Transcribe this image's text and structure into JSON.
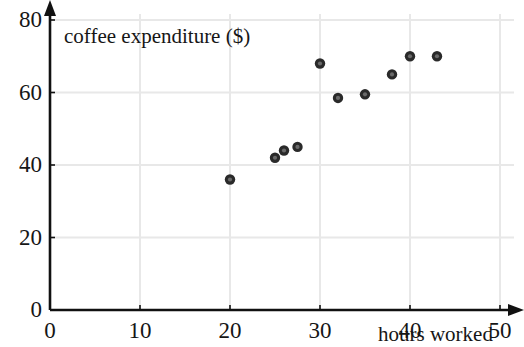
{
  "chart_data": {
    "type": "scatter",
    "title": "",
    "xlabel": "hours worked",
    "ylabel": "coffee expenditure ($)",
    "xlim": [
      0,
      50
    ],
    "ylim": [
      0,
      80
    ],
    "xticks": [
      0,
      10,
      20,
      30,
      40,
      50
    ],
    "yticks": [
      0,
      20,
      40,
      60,
      80
    ],
    "xtick_labels": [
      "0",
      "10",
      "20",
      "30",
      "40",
      "50"
    ],
    "ytick_labels": [
      "0",
      "20",
      "40",
      "60",
      "80"
    ],
    "grid": true,
    "grid_color": "#e8e8e8",
    "legend": null,
    "marker_color": "#3b3b3b",
    "axis_color": "#111111",
    "points": [
      {
        "x": 20,
        "y": 36
      },
      {
        "x": 25,
        "y": 42
      },
      {
        "x": 26,
        "y": 44
      },
      {
        "x": 27.5,
        "y": 45
      },
      {
        "x": 30,
        "y": 68
      },
      {
        "x": 32,
        "y": 58.5
      },
      {
        "x": 35,
        "y": 59.5
      },
      {
        "x": 38,
        "y": 65
      },
      {
        "x": 40,
        "y": 70
      },
      {
        "x": 43,
        "y": 70
      }
    ],
    "series": [
      {
        "name": "coffee expenditure vs hours worked",
        "x": [
          20,
          25,
          26,
          27.5,
          30,
          32,
          35,
          38,
          40,
          43
        ],
        "values": [
          36,
          42,
          44,
          45,
          68,
          58.5,
          59.5,
          65,
          70,
          70
        ]
      }
    ]
  }
}
